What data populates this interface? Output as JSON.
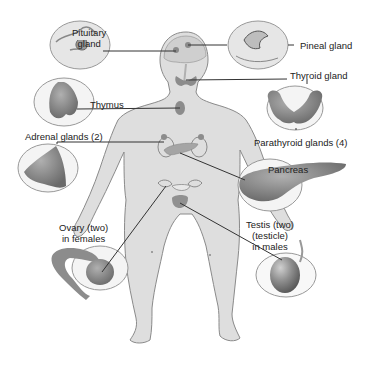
{
  "diagram": {
    "labels": {
      "pituitary_line1": "Pituitary",
      "pituitary_line2": "gland",
      "pineal": "Pineal gland",
      "thyroid": "Thyroid gland",
      "thymus": "Thymus",
      "adrenal": "Adrenal glands (2)",
      "parathyroid": "Parathyroid glands (4)",
      "pancreas": "Pancreas",
      "ovary_line1": "Ovary (two)",
      "ovary_line2": "in females",
      "testis_line1": "Testis (two)",
      "testis_line2": "(testicle)",
      "testis_line3": "in males"
    },
    "colors": {
      "body_fill": "#dcdcdc",
      "body_stroke": "#8a8a8a",
      "organ_fill": "#8c8c8c",
      "organ_dark": "#6e6e6e",
      "callout_stroke": "#9a9a9a",
      "leader_line": "#333333"
    }
  }
}
